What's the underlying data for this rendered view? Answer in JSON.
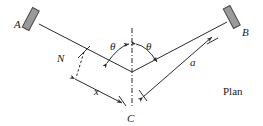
{
  "figure": {
    "caption": "Plan",
    "type": "engineering-plan-diagram"
  },
  "labels": {
    "point_a": "A",
    "point_b": "B",
    "point_c": "C",
    "point_n": "N",
    "angle_left": "θ",
    "angle_right": "θ",
    "dimension_x": "x",
    "dimension_a": "a",
    "view_name": "Plan"
  },
  "colors": {
    "line": "#2b2b2b",
    "support_fill": "#9a9a9a",
    "support_stroke": "#4a4a4a",
    "background": "#ffffff",
    "text": "#1a1a1a"
  },
  "geometry": {
    "vertex_c": [
      132,
      72
    ],
    "anchor_a": [
      40,
      22
    ],
    "anchor_b": [
      226,
      20
    ],
    "point_n": [
      84,
      54
    ],
    "centerline_top": [
      132,
      28
    ],
    "centerline_bottom": [
      132,
      108
    ]
  },
  "icons": {
    "support_left": "wall-support-icon",
    "support_right": "wall-support-icon"
  }
}
